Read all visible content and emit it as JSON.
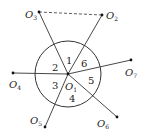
{
  "diagram": {
    "type": "geometry",
    "circle": {
      "center_label": "O",
      "center_sub": "1",
      "cx": 68,
      "cy": 74,
      "r": 33
    },
    "points": [
      {
        "id": "O2",
        "label": "O",
        "sub": "2",
        "x": 102,
        "y": 15,
        "lx": 106,
        "ly": 19
      },
      {
        "id": "O3",
        "label": "O",
        "sub": "3",
        "x": 39,
        "y": 12,
        "lx": 25,
        "ly": 18
      },
      {
        "id": "O4",
        "label": "O",
        "sub": "4",
        "x": 13,
        "y": 73,
        "lx": 9,
        "ly": 88
      },
      {
        "id": "O5",
        "label": "O",
        "sub": "5",
        "x": 45,
        "y": 127,
        "lx": 30,
        "ly": 124
      },
      {
        "id": "O6",
        "label": "O",
        "sub": "6",
        "x": 117,
        "y": 117,
        "lx": 97,
        "ly": 127
      },
      {
        "id": "O7",
        "label": "O",
        "sub": "7",
        "x": 131,
        "y": 60,
        "lx": 125,
        "ly": 76
      }
    ],
    "regions": [
      {
        "label": "1",
        "x": 66,
        "y": 64
      },
      {
        "label": "2",
        "x": 52,
        "y": 71
      },
      {
        "label": "3",
        "x": 52,
        "y": 89
      },
      {
        "label": "4",
        "x": 69,
        "y": 102
      },
      {
        "label": "5",
        "x": 88,
        "y": 84
      },
      {
        "label": "6",
        "x": 81,
        "y": 67
      }
    ],
    "dashed_segment": [
      "O3",
      "O2"
    ],
    "center_label_pos": {
      "x": 65,
      "y": 90
    }
  }
}
